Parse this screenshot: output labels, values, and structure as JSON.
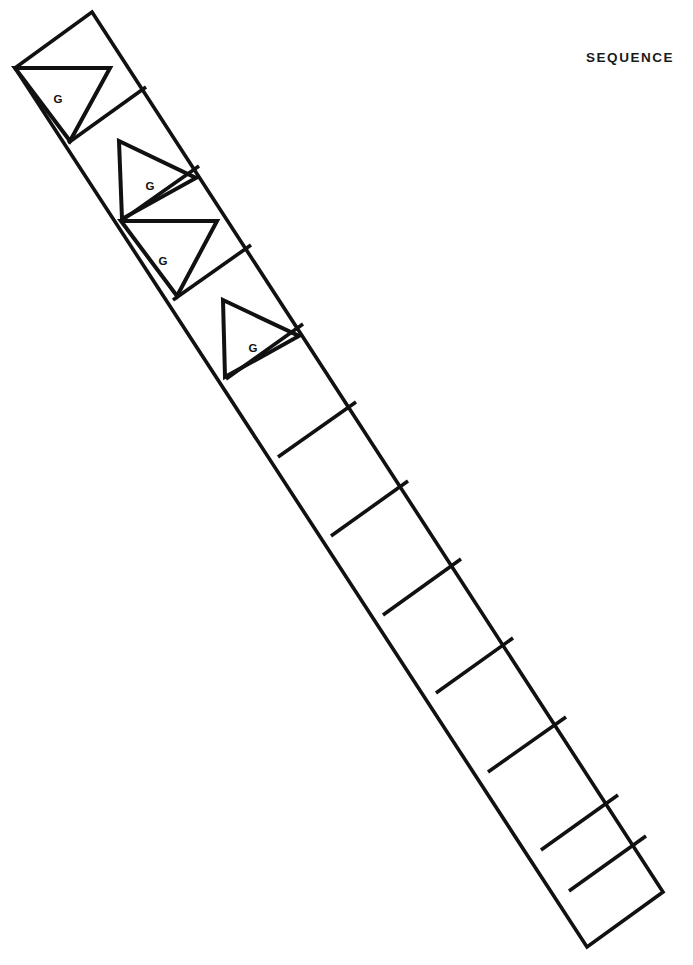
{
  "figure": {
    "title": "SEQUENCE",
    "background_color": "#ffffff",
    "line_color": "#111111"
  },
  "strip": {
    "orientation": "diagonal descending from upper-left to lower-right",
    "corners": {
      "top": [
        92,
        12
      ],
      "left": [
        15,
        68
      ],
      "bottom": [
        587,
        947
      ],
      "right": [
        663,
        892
      ]
    },
    "cell_count": 12,
    "cells": [
      {
        "index": 1,
        "label": "G",
        "symbol": "triangle",
        "triangle_direction": "left",
        "label_x": 58,
        "label_y": 99
      },
      {
        "index": 2,
        "label": "G",
        "symbol": "triangle",
        "triangle_direction": "right",
        "label_x": 150,
        "label_y": 186
      },
      {
        "index": 3,
        "label": "G",
        "symbol": "triangle",
        "triangle_direction": "left",
        "label_x": 163,
        "label_y": 261
      },
      {
        "index": 4,
        "label": "G",
        "symbol": "triangle",
        "triangle_direction": "right",
        "label_x": 253,
        "label_y": 348
      },
      {
        "index": 5,
        "label": "",
        "symbol": "none",
        "triangle_direction": "",
        "label_x": 0,
        "label_y": 0
      },
      {
        "index": 6,
        "label": "",
        "symbol": "none",
        "triangle_direction": "",
        "label_x": 0,
        "label_y": 0
      },
      {
        "index": 7,
        "label": "",
        "symbol": "none",
        "triangle_direction": "",
        "label_x": 0,
        "label_y": 0
      },
      {
        "index": 8,
        "label": "",
        "symbol": "none",
        "triangle_direction": "",
        "label_x": 0,
        "label_y": 0
      },
      {
        "index": 9,
        "label": "",
        "symbol": "none",
        "triangle_direction": "",
        "label_x": 0,
        "label_y": 0
      },
      {
        "index": 10,
        "label": "",
        "symbol": "none",
        "triangle_direction": "",
        "label_x": 0,
        "label_y": 0
      },
      {
        "index": 11,
        "label": "",
        "symbol": "none",
        "triangle_direction": "",
        "label_x": 0,
        "label_y": 0
      },
      {
        "index": 12,
        "label": "",
        "symbol": "none",
        "triangle_direction": "",
        "label_x": 0,
        "label_y": 0
      }
    ],
    "dividers": [
      {
        "index": 1,
        "x1": 68,
        "y1": 143,
        "x2": 146,
        "y2": 87
      },
      {
        "index": 2,
        "x1": 121,
        "y1": 221,
        "x2": 199,
        "y2": 166
      },
      {
        "index": 3,
        "x1": 173,
        "y1": 300,
        "x2": 251,
        "y2": 245
      },
      {
        "index": 4,
        "x1": 226,
        "y1": 379,
        "x2": 303,
        "y2": 324
      },
      {
        "index": 5,
        "x1": 278,
        "y1": 457,
        "x2": 356,
        "y2": 402
      },
      {
        "index": 6,
        "x1": 331,
        "y1": 536,
        "x2": 408,
        "y2": 481
      },
      {
        "index": 7,
        "x1": 383,
        "y1": 615,
        "x2": 461,
        "y2": 559
      },
      {
        "index": 8,
        "x1": 436,
        "y1": 693,
        "x2": 513,
        "y2": 638
      },
      {
        "index": 9,
        "x1": 488,
        "y1": 772,
        "x2": 566,
        "y2": 717
      },
      {
        "index": 10,
        "x1": 541,
        "y1": 850,
        "x2": 618,
        "y2": 795
      },
      {
        "index": 11,
        "x1": 569,
        "y1": 891,
        "x2": 646,
        "y2": 836
      }
    ],
    "triangles": [
      {
        "index": 1,
        "direction": "left",
        "points": "15,68 110,68 70,141"
      },
      {
        "index": 2,
        "direction": "right",
        "points": "119,141 196,178 122,219"
      },
      {
        "index": 3,
        "direction": "left",
        "points": "121,221 217,221 177,296"
      },
      {
        "index": 4,
        "direction": "right",
        "points": "223,300 299,336 225,377"
      }
    ]
  }
}
